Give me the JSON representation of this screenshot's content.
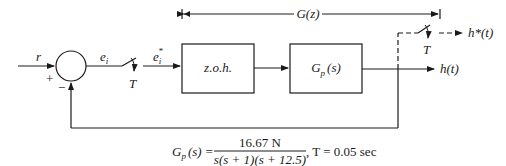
{
  "diagram": {
    "input_label": "r",
    "plus_sign": "+",
    "minus_sign": "−",
    "error_label": "e",
    "error_subscript": "i",
    "sampled_error_label": "e",
    "sampled_error_subscript": "i",
    "sampled_error_superscript": "*",
    "sampler1_period": "T",
    "sampler2_period": "T",
    "zoh_block": "z.o.h.",
    "plant_block_main": "G",
    "plant_block_sub": "p",
    "plant_block_arg": "(s)",
    "bracket_label": "G(z)",
    "output_label": "h(t)",
    "sampled_output_label": "h*(t)"
  },
  "equation": {
    "lhs_main": "G",
    "lhs_sub": "p",
    "lhs_arg": "(s) =",
    "numerator": "16.67 N",
    "denominator": "s(s + 1)(s + 12.5)",
    "suffix": ", T = 0.05 sec"
  },
  "colors": {
    "line": "#1a1a1a",
    "background": "#ffffff"
  }
}
